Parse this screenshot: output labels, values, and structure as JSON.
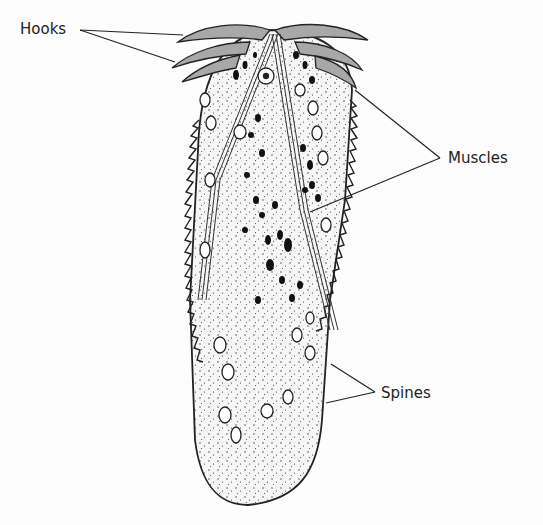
{
  "figure": {
    "labels": [
      {
        "id": "hooks",
        "text": "Hooks",
        "x": 20,
        "y": 22
      },
      {
        "id": "muscles",
        "text": "Muscles",
        "x": 450,
        "y": 147
      },
      {
        "id": "spines",
        "text": "Spines",
        "x": 382,
        "y": 385
      }
    ],
    "colors": {
      "ink": "#222222",
      "hook_fill": "#a8a8a8",
      "body_fill": "#f4f4f4",
      "background": "#fdfdfd"
    }
  }
}
